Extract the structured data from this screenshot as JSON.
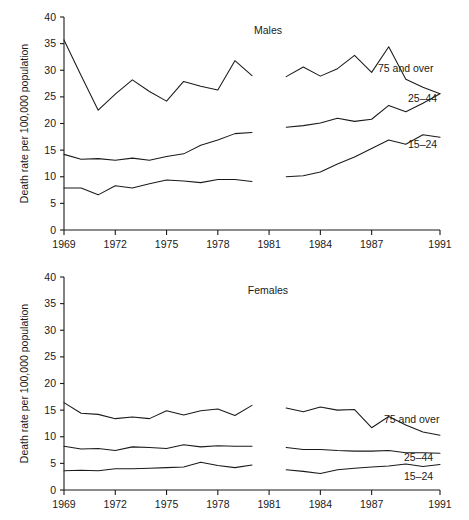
{
  "chart_data": [
    {
      "type": "line",
      "title": "Males",
      "xlabel": "",
      "ylabel": "Death rate per 100,000 population",
      "xlim": [
        1969,
        1991
      ],
      "ylim": [
        0,
        40
      ],
      "ytick_labels": [
        "0",
        "5",
        "10",
        "15",
        "20",
        "25",
        "30",
        "35",
        "40"
      ],
      "yticks": [
        0,
        5,
        10,
        15,
        20,
        25,
        30,
        35,
        40
      ],
      "xtick_labels": [
        "1969",
        "1972",
        "1975",
        "1978",
        "1981",
        "1984",
        "1987",
        "1991"
      ],
      "xticks": [
        1969,
        1972,
        1975,
        1978,
        1981,
        1984,
        1987,
        1991
      ],
      "grid": false,
      "legend_position": "inline-right",
      "break_in_series": "Series are split into two segments: 1969-1980 and 1982-1991",
      "series": [
        {
          "name": "75 and over",
          "label": "75 and over",
          "segments": [
            {
              "x": [
                1969,
                1970,
                1971,
                1972,
                1973,
                1974,
                1975,
                1976,
                1977,
                1978,
                1979,
                1980
              ],
              "values": [
                35.7,
                29.0,
                22.5,
                25.5,
                28.2,
                26.0,
                24.2,
                27.9,
                27.0,
                26.3,
                31.8,
                29.0
              ]
            },
            {
              "x": [
                1982,
                1983,
                1984,
                1985,
                1986,
                1987,
                1988,
                1989,
                1990,
                1991
              ],
              "values": [
                28.8,
                30.6,
                28.9,
                30.3,
                32.8,
                29.6,
                34.4,
                28.3,
                26.8,
                25.6
              ]
            }
          ]
        },
        {
          "name": "25-44",
          "label": "25–44",
          "segments": [
            {
              "x": [
                1969,
                1970,
                1971,
                1972,
                1973,
                1974,
                1975,
                1976,
                1977,
                1978,
                1979,
                1980
              ],
              "values": [
                14.2,
                13.3,
                13.4,
                13.1,
                13.5,
                13.1,
                13.8,
                14.3,
                15.9,
                16.9,
                18.1,
                18.3
              ]
            },
            {
              "x": [
                1982,
                1983,
                1984,
                1985,
                1986,
                1987,
                1988,
                1989,
                1990,
                1991
              ],
              "values": [
                19.3,
                19.6,
                20.1,
                21.0,
                20.4,
                20.8,
                23.4,
                22.2,
                23.8,
                25.6
              ]
            }
          ]
        },
        {
          "name": "15-24",
          "label": "15–24",
          "segments": [
            {
              "x": [
                1969,
                1970,
                1971,
                1972,
                1973,
                1974,
                1975,
                1976,
                1977,
                1978,
                1979,
                1980
              ],
              "values": [
                7.9,
                7.9,
                6.6,
                8.3,
                7.9,
                8.7,
                9.4,
                9.2,
                8.9,
                9.5,
                9.5,
                9.1
              ]
            },
            {
              "x": [
                1982,
                1983,
                1984,
                1985,
                1986,
                1987,
                1988,
                1989,
                1990,
                1991
              ],
              "values": [
                10.0,
                10.2,
                10.9,
                12.4,
                13.7,
                15.3,
                16.9,
                16.1,
                17.9,
                17.4
              ]
            }
          ]
        }
      ]
    },
    {
      "type": "line",
      "title": "Females",
      "xlabel": "",
      "ylabel": "Death rate per 100,000 population",
      "xlim": [
        1969,
        1991
      ],
      "ylim": [
        0,
        40
      ],
      "ytick_labels": [
        "0",
        "5",
        "10",
        "15",
        "20",
        "25",
        "30",
        "35",
        "40"
      ],
      "yticks": [
        0,
        5,
        10,
        15,
        20,
        25,
        30,
        35,
        40
      ],
      "xtick_labels": [
        "1969",
        "1972",
        "1975",
        "1978",
        "1981",
        "1984",
        "1987",
        "1991"
      ],
      "xticks": [
        1969,
        1972,
        1975,
        1978,
        1981,
        1984,
        1987,
        1991
      ],
      "grid": false,
      "legend_position": "inline-right",
      "break_in_series": "Series are split into two segments: 1969-1980 and 1982-1991",
      "series": [
        {
          "name": "75 and over",
          "label": "75 and over",
          "segments": [
            {
              "x": [
                1969,
                1970,
                1971,
                1972,
                1973,
                1974,
                1975,
                1976,
                1977,
                1978,
                1979,
                1980
              ],
              "values": [
                16.4,
                14.4,
                14.2,
                13.4,
                13.7,
                13.4,
                14.9,
                14.1,
                14.9,
                15.2,
                14.0,
                15.9
              ]
            },
            {
              "x": [
                1982,
                1983,
                1984,
                1985,
                1986,
                1987,
                1988,
                1989,
                1990,
                1991
              ],
              "values": [
                15.4,
                14.7,
                15.6,
                15.0,
                15.1,
                11.7,
                13.8,
                12.2,
                10.9,
                10.3
              ]
            }
          ]
        },
        {
          "name": "25-44",
          "label": "25–44",
          "segments": [
            {
              "x": [
                1969,
                1970,
                1971,
                1972,
                1973,
                1974,
                1975,
                1976,
                1977,
                1978,
                1979,
                1980
              ],
              "values": [
                8.2,
                7.7,
                7.8,
                7.4,
                8.1,
                8.0,
                7.8,
                8.5,
                8.1,
                8.3,
                8.2,
                8.2
              ]
            },
            {
              "x": [
                1982,
                1983,
                1984,
                1985,
                1986,
                1987,
                1988,
                1989,
                1990,
                1991
              ],
              "values": [
                8.0,
                7.6,
                7.6,
                7.4,
                7.3,
                7.3,
                7.4,
                7.0,
                7.0,
                6.9
              ]
            }
          ]
        },
        {
          "name": "15-24",
          "label": "15–24",
          "segments": [
            {
              "x": [
                1969,
                1970,
                1971,
                1972,
                1973,
                1974,
                1975,
                1976,
                1977,
                1978,
                1979,
                1980
              ],
              "values": [
                3.6,
                3.7,
                3.6,
                4.0,
                4.0,
                4.1,
                4.2,
                4.3,
                5.2,
                4.6,
                4.2,
                4.7
              ]
            },
            {
              "x": [
                1982,
                1983,
                1984,
                1985,
                1986,
                1987,
                1988,
                1989,
                1990,
                1991
              ],
              "values": [
                3.8,
                3.5,
                3.1,
                3.8,
                4.1,
                4.3,
                4.5,
                4.9,
                4.4,
                4.8
              ]
            }
          ]
        }
      ]
    }
  ],
  "panels": [
    {
      "key": "males",
      "title": "Males",
      "ylabel": "Death rate per 100,000 population",
      "labels": [
        "75 and over",
        "25–44",
        "15–24"
      ]
    },
    {
      "key": "females",
      "title": "Females",
      "ylabel": "Death rate per 100,000 population",
      "labels": [
        "75 and over",
        "25–44",
        "15–24"
      ]
    }
  ]
}
